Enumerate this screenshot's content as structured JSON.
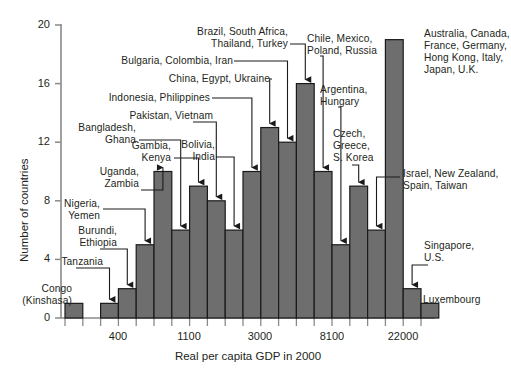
{
  "chart_data": {
    "type": "bar",
    "title": "",
    "xlabel": "Real per capita GDP in 2000",
    "ylabel": "Number of countries",
    "ylim": [
      0,
      20
    ],
    "yticks": [
      0,
      4,
      8,
      12,
      16,
      20
    ],
    "xtick_labels": [
      "400",
      "1100",
      "3000",
      "8100",
      "22000"
    ],
    "xtick_bins": [
      3,
      7,
      11,
      15,
      19
    ],
    "grid": false,
    "legend": "none",
    "bar_color": "#6e6e6e",
    "bar_edge_color": "#1a1a1a",
    "axis_color": "#808080",
    "categories": [
      "1",
      "2",
      "3",
      "4",
      "5",
      "6",
      "7",
      "8",
      "9",
      "10",
      "11",
      "12",
      "13",
      "14",
      "15",
      "16",
      "17",
      "18",
      "19",
      "20",
      "21"
    ],
    "values": [
      1,
      0,
      1,
      2,
      5,
      10,
      6,
      9,
      8,
      6,
      10,
      13,
      12,
      16,
      10,
      5,
      9,
      6,
      19,
      2,
      1
    ],
    "annotations": [
      {
        "id": "congo",
        "text": "Congo\n(Kinshasa)",
        "bin": 1,
        "value": 1
      },
      {
        "id": "tanzania",
        "text": "Tanzania",
        "bin": 3,
        "value": 1
      },
      {
        "id": "burundi-ethiopia",
        "text": "Burundi,\nEthiopia",
        "bin": 4,
        "value": 2
      },
      {
        "id": "nigeria-yemen",
        "text": "Nigeria,\nYemen",
        "bin": 5,
        "value": 5
      },
      {
        "id": "uganda-zambia",
        "text": "Uganda,\nZambia",
        "bin": 6,
        "value": 10
      },
      {
        "id": "bangladesh-ghana",
        "text": "Bangladesh,\nGhana",
        "bin": 7,
        "value": 6
      },
      {
        "id": "gambia-kenya",
        "text": "Gambia,\nKenya",
        "bin": 8,
        "value": 9
      },
      {
        "id": "pakistan-vietnam",
        "text": "Pakistan, Vietnam",
        "bin": 9,
        "value": 8
      },
      {
        "id": "bolivia-india",
        "text": "Bolivia,\nIndia",
        "bin": 10,
        "value": 6
      },
      {
        "id": "indonesia-philippines",
        "text": "Indonesia, Philippines",
        "bin": 11,
        "value": 10
      },
      {
        "id": "china-egypt-ukraine",
        "text": "China, Egypt, Ukraine",
        "bin": 12,
        "value": 13
      },
      {
        "id": "bulgaria-colombia-iran",
        "text": "Bulgaria, Colombia, Iran",
        "bin": 13,
        "value": 12
      },
      {
        "id": "brazil-southafrica-thailand-turkey",
        "text": "Brazil, South Africa,\nThailand, Turkey",
        "bin": 14,
        "value": 16
      },
      {
        "id": "chile-mexico-poland-russia",
        "text": "Chile, Mexico,\nPoland, Russia",
        "bin": 15,
        "value": 10
      },
      {
        "id": "argentina-hungary",
        "text": "Argentina,\nHungary",
        "bin": 16,
        "value": 5
      },
      {
        "id": "czech-greece-skorea",
        "text": "Czech,\nGreece,\nS. Korea",
        "bin": 17,
        "value": 9
      },
      {
        "id": "israel-newzealand-spain-taiwan",
        "text": "Israel, New Zealand,\nSpain, Taiwan",
        "bin": 18,
        "value": 6
      },
      {
        "id": "australia-canada-france-germany-hongkong-italy-japan-uk",
        "text": "Australia, Canada,\nFrance, Germany,\nHong Kong, Italy,\nJapan, U.K.",
        "bin": 19,
        "value": 19
      },
      {
        "id": "singapore-us",
        "text": "Singapore,\nU.S.",
        "bin": 20,
        "value": 2
      },
      {
        "id": "luxembourg",
        "text": "Luxembourg",
        "bin": 21,
        "value": 1
      }
    ]
  },
  "labels": {
    "congo": "Congo",
    "congo2": "(Kinshasa)",
    "tanzania": "Tanzania",
    "burundi1": "Burundi,",
    "burundi2": "Ethiopia",
    "nigeria1": "Nigeria,",
    "nigeria2": "Yemen",
    "uganda1": "Uganda,",
    "uganda2": "Zambia",
    "bangladesh1": "Bangladesh,",
    "bangladesh2": "Ghana",
    "gambia1": "Gambia,",
    "gambia2": "Kenya",
    "pakistan": "Pakistan, Vietnam",
    "bolivia1": "Bolivia,",
    "bolivia2": "India",
    "indonesia": "Indonesia, Philippines",
    "china": "China, Egypt, Ukraine",
    "bulgaria": "Bulgaria, Colombia, Iran",
    "brazil1": "Brazil, South Africa,",
    "brazil2": "Thailand, Turkey",
    "chile1": "Chile, Mexico,",
    "chile2": "Poland, Russia",
    "argentina1": "Argentina,",
    "argentina2": "Hungary",
    "czech1": "Czech,",
    "czech2": "Greece,",
    "czech3": "S. Korea",
    "israel1": "Israel, New Zealand,",
    "israel2": "Spain, Taiwan",
    "aus1": "Australia, Canada,",
    "aus2": "France, Germany,",
    "aus3": "Hong Kong, Italy,",
    "aus4": "Japan, U.K.",
    "singapore1": "Singapore,",
    "singapore2": "U.S.",
    "luxembourg": "Luxembourg"
  },
  "axes": {
    "ylabel": "Number of countries",
    "xlabel": "Real per capita GDP in 2000",
    "y0": "0",
    "y4": "4",
    "y8": "8",
    "y12": "12",
    "y16": "16",
    "y20": "20",
    "x400": "400",
    "x1100": "1100",
    "x3000": "3000",
    "x8100": "8100",
    "x22000": "22000"
  }
}
